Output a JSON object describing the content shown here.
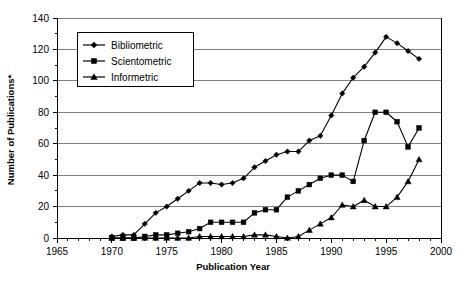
{
  "chart_data": {
    "type": "line",
    "title": "",
    "xlabel": "Publication Year",
    "ylabel": "Number of Publications*",
    "xlim": [
      1965,
      2000
    ],
    "ylim": [
      0,
      140
    ],
    "xticks": [
      1965,
      1970,
      1975,
      1980,
      1985,
      1990,
      1995,
      2000
    ],
    "xtick_labels": [
      "1965",
      "1970",
      "1975",
      "1980",
      "1985",
      "1990",
      "1995",
      "2000"
    ],
    "yticks": [
      0,
      20,
      40,
      60,
      80,
      100,
      120,
      140
    ],
    "ytick_labels": [
      "0",
      "20",
      "40",
      "60",
      "80",
      "100",
      "120",
      "140"
    ],
    "minor_xtick_interval": 1,
    "grid": "horizontal",
    "legend_position": "upper-left-inside",
    "x": [
      1970,
      1971,
      1972,
      1973,
      1974,
      1975,
      1976,
      1977,
      1978,
      1979,
      1980,
      1981,
      1982,
      1983,
      1984,
      1985,
      1986,
      1987,
      1988,
      1989,
      1990,
      1991,
      1992,
      1993,
      1994,
      1995,
      1996,
      1997,
      1998
    ],
    "series": [
      {
        "name": "Bibliometric",
        "marker": "diamond",
        "values": [
          1,
          2,
          2,
          9,
          16,
          20,
          25,
          30,
          35,
          35,
          34,
          35,
          38,
          45,
          49,
          53,
          55,
          55,
          62,
          65,
          78,
          92,
          102,
          109,
          118,
          128,
          124,
          119,
          114
        ]
      },
      {
        "name": "Scientometric",
        "marker": "square",
        "values": [
          0,
          0,
          0,
          1,
          2,
          2,
          3,
          4,
          6,
          10,
          10,
          10,
          10,
          16,
          18,
          18,
          26,
          30,
          34,
          38,
          40,
          40,
          36,
          62,
          80,
          80,
          74,
          58,
          70
        ]
      },
      {
        "name": "Informetric",
        "marker": "triangle",
        "values": [
          0,
          0,
          0,
          0,
          0,
          0,
          0,
          0,
          1,
          1,
          1,
          1,
          1,
          2,
          2,
          1,
          0,
          1,
          5,
          9,
          13,
          21,
          20,
          24,
          20,
          20,
          26,
          36,
          50
        ]
      }
    ]
  },
  "legend": {
    "entries": [
      {
        "label": "Bibliometric",
        "marker": "diamond"
      },
      {
        "label": "Scientometric",
        "marker": "square"
      },
      {
        "label": "Informetric",
        "marker": "triangle"
      }
    ]
  }
}
